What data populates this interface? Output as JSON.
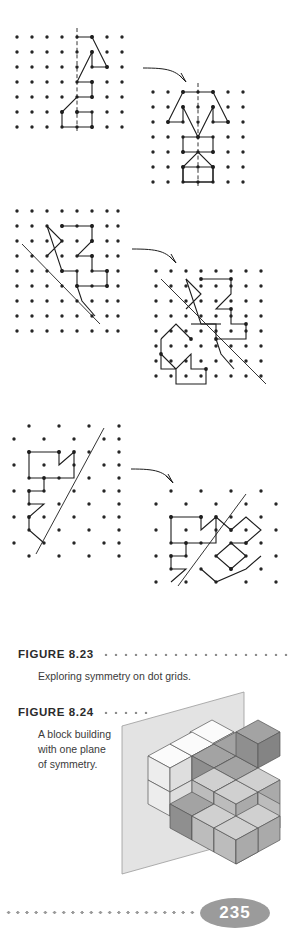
{
  "page": {
    "number": "235",
    "background": "#ffffff"
  },
  "figures": [
    {
      "id": "figure-8-23",
      "label": "FIGURE 8.23",
      "caption": "Exploring symmetry on dot grids.",
      "panels": [
        {
          "name": "square-grid-vertical-mirror-before",
          "grid_type": "square",
          "grid_cols": 8,
          "grid_rows": 7,
          "mirror_line": "vertical",
          "shape": "half figure drawn left of vertical mirror line"
        },
        {
          "name": "square-grid-vertical-mirror-after",
          "grid_type": "square",
          "grid_cols": 7,
          "grid_rows": 7,
          "mirror_line": "vertical",
          "shape": "completed bilaterally symmetric figure"
        },
        {
          "name": "square-grid-diagonal-mirror-before",
          "grid_type": "square",
          "grid_cols": 8,
          "grid_rows": 8,
          "mirror_line": "diagonal",
          "shape": "zigzag polyline above the diagonal mirror line"
        },
        {
          "name": "square-grid-diagonal-mirror-after",
          "grid_type": "square",
          "grid_cols": 8,
          "grid_rows": 8,
          "mirror_line": "diagonal",
          "shape": "completed figure reflected across the diagonal"
        },
        {
          "name": "triangular-grid-oblique-mirror-before",
          "grid_type": "triangular",
          "grid_cols": 7,
          "grid_rows": 9,
          "mirror_line": "oblique",
          "shape": "angular polyline left of the oblique mirror line"
        },
        {
          "name": "triangular-grid-oblique-mirror-after",
          "grid_type": "triangular",
          "grid_cols": 7,
          "grid_rows": 9,
          "mirror_line": "oblique",
          "shape": "completed figure reflected across the oblique line"
        }
      ],
      "arrows": 3
    },
    {
      "id": "figure-8-24",
      "label": "FIGURE 8.24",
      "caption": "A block building\nwith one plane\nof symmetry.",
      "caption_lines": [
        "A block building",
        "with one plane",
        "of symmetry."
      ],
      "illustration": "isometric block building in front of a vertical plane of symmetry"
    }
  ],
  "colors": {
    "ink": "#1d1d1d",
    "dot": "#262626",
    "caption_heading": "#2b2b2b",
    "caption_body": "#3a3a3a",
    "dot_rule": "#8c8c8c",
    "plane_fill": "#e3e3e3",
    "plane_stroke": "#9a9a9a",
    "cube_top_light": "#f2f2f2",
    "cube_left_light": "#e0e0e0",
    "cube_right_light": "#cfcfcf",
    "cube_top_mid": "#d2d2d2",
    "cube_left_mid": "#bdbdbd",
    "cube_right_mid": "#ababab",
    "cube_top_dark": "#a9a9a9",
    "cube_left_dark": "#969696",
    "cube_right_dark": "#868686",
    "badge_fill": "#9b9b9b",
    "badge_text": "#ffffff"
  }
}
